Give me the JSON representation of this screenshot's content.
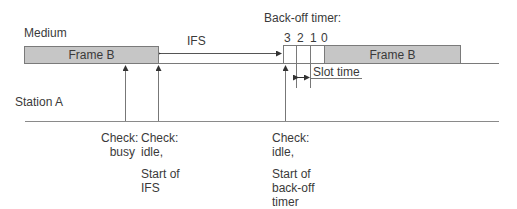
{
  "diagram": {
    "title": "Back-off timer:",
    "rows": {
      "medium": "Medium",
      "station": "Station A"
    },
    "frames": [
      {
        "label": "Frame B",
        "position": "before"
      },
      {
        "label": "Frame B",
        "position": "after"
      }
    ],
    "ifs_label": "IFS",
    "slot_numbers": [
      "3",
      "2",
      "1",
      "0"
    ],
    "slot_time_label": "Slot time",
    "events": [
      {
        "line1": "Check:",
        "line2": "busy"
      },
      {
        "line1": "Check:",
        "line2": "idle,",
        "line3": "Start of",
        "line4": "IFS"
      },
      {
        "line1": "Check:",
        "line2": "idle,",
        "line3": "Start of",
        "line4": "back-off",
        "line5": "timer"
      }
    ],
    "colors": {
      "frame_fill": "#c6c6c6",
      "line": "#7a7a7a",
      "text": "#3a3a3a"
    }
  }
}
